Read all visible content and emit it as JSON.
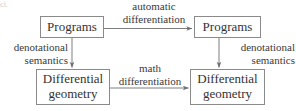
{
  "diagram": {
    "type": "commutative-diagram",
    "title": "",
    "colors": {
      "background": "#ffffff",
      "box_border": "#8a8a8a",
      "text": "#333333",
      "arrow": "#6f6f6f"
    },
    "nodes": [
      {
        "id": "top-left",
        "lines": [
          "Programs"
        ],
        "x": 40,
        "y": 16,
        "w": 64,
        "h": 22
      },
      {
        "id": "top-right",
        "lines": [
          "Programs"
        ],
        "x": 194,
        "y": 16,
        "w": 67,
        "h": 22
      },
      {
        "id": "bottom-left",
        "lines": [
          "Differential",
          "geometry"
        ],
        "x": 36,
        "y": 69,
        "w": 74,
        "h": 36
      },
      {
        "id": "bottom-right",
        "lines": [
          "Differential",
          "geometry"
        ],
        "x": 190,
        "y": 69,
        "w": 75,
        "h": 36
      }
    ],
    "edges": [
      {
        "id": "top-edge",
        "from": "top-left",
        "to": "top-right",
        "direction": "right",
        "label_lines": [
          "automatic",
          "differentiation"
        ]
      },
      {
        "id": "left-edge",
        "from": "top-left",
        "to": "bottom-left",
        "direction": "down",
        "label_lines": [
          "denotational",
          "semantics"
        ]
      },
      {
        "id": "right-edge",
        "from": "top-right",
        "to": "bottom-right",
        "direction": "down",
        "label_lines": [
          "denotational",
          "semantics"
        ]
      },
      {
        "id": "bottom-edge",
        "from": "bottom-left",
        "to": "bottom-right",
        "direction": "right",
        "label_lines": [
          "math",
          "differentiation"
        ]
      }
    ]
  },
  "artifact": {
    "text": "cj,"
  }
}
